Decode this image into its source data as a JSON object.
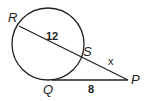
{
  "diagram": {
    "type": "secant-tangent circle geometry",
    "points": {
      "R": "R",
      "S": "S",
      "P": "P",
      "Q": "Q"
    },
    "segments": {
      "RS_length": "12",
      "SP_length": "x",
      "QP_length": "8"
    },
    "colors": {
      "stroke": "#222222",
      "background": "#ffffff"
    }
  }
}
